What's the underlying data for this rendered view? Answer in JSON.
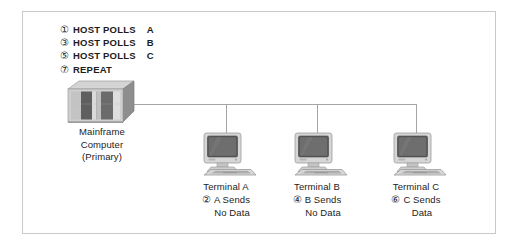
{
  "figure": {
    "border_color": "#c9c9c9",
    "wire_color": "#a5a5a5",
    "text_color": "#1c1c1c"
  },
  "poll_sequence": [
    {
      "num": "①",
      "action": "HOST POLLS",
      "target": "A"
    },
    {
      "num": "③",
      "action": "HOST POLLS",
      "target": "B"
    },
    {
      "num": "⑤",
      "action": "HOST POLLS",
      "target": "C"
    },
    {
      "num": "⑦",
      "action": "REPEAT",
      "target": ""
    }
  ],
  "mainframe": {
    "icon": "mainframe-computer-icon",
    "line1": "Mainframe",
    "line2": "Computer",
    "line3": "(Primary)"
  },
  "terminals": [
    {
      "icon": "desktop-terminal-icon",
      "name": "Terminal A",
      "num": "②",
      "note_line1": "A Sends",
      "note_line2": "No Data"
    },
    {
      "icon": "desktop-terminal-icon",
      "name": "Terminal B",
      "num": "④",
      "note_line1": "B Sends",
      "note_line2": "No Data"
    },
    {
      "icon": "desktop-terminal-icon",
      "name": "Terminal C",
      "num": "⑥",
      "note_line1": "C Sends",
      "note_line2": "Data"
    }
  ]
}
